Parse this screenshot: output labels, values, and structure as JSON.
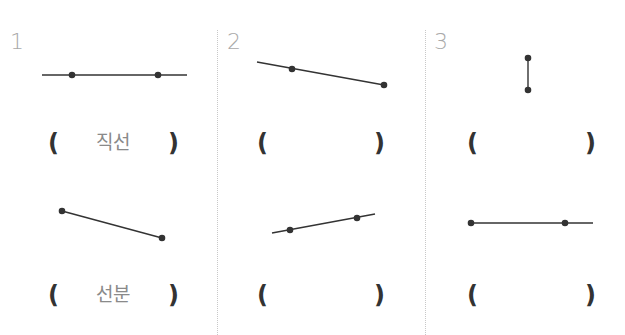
{
  "problems": [
    {
      "number": "1",
      "answers": [
        "직선",
        "선분"
      ]
    },
    {
      "number": "2",
      "answers": [
        "",
        ""
      ]
    },
    {
      "number": "3",
      "answers": [
        "",
        ""
      ]
    }
  ],
  "brackets": {
    "open": "(",
    "close": ")"
  },
  "figures": [
    {
      "id": "p1-top",
      "kind": "line",
      "x1": 42,
      "y1": 75,
      "x2": 187,
      "y2": 75,
      "dots": [
        [
          72,
          75
        ],
        [
          158,
          75
        ]
      ]
    },
    {
      "id": "p1-bottom",
      "kind": "segment",
      "x1": 62,
      "y1": 211,
      "x2": 162,
      "y2": 238,
      "dots": [
        [
          62,
          211
        ],
        [
          162,
          238
        ]
      ]
    },
    {
      "id": "p2-top",
      "kind": "ray",
      "x1": 257,
      "y1": 62,
      "x2": 384,
      "y2": 85,
      "dots": [
        [
          292,
          69
        ],
        [
          384,
          85
        ]
      ]
    },
    {
      "id": "p2-bottom",
      "kind": "line",
      "x1": 272,
      "y1": 233,
      "x2": 375,
      "y2": 214,
      "dots": [
        [
          290,
          230
        ],
        [
          357,
          218
        ]
      ]
    },
    {
      "id": "p3-top",
      "kind": "segment",
      "x1": 528,
      "y1": 58,
      "x2": 528,
      "y2": 90,
      "dots": [
        [
          528,
          58
        ],
        [
          528,
          90
        ]
      ]
    },
    {
      "id": "p3-bottom",
      "kind": "ray",
      "x1": 471,
      "y1": 223,
      "x2": 593,
      "y2": 223,
      "dots": [
        [
          471,
          223
        ],
        [
          565,
          223
        ]
      ]
    }
  ],
  "colors": {
    "stroke": "#333333",
    "number": "#a9a9a9",
    "answer": "#8a8a8a",
    "divider": "#c8c8c8"
  }
}
